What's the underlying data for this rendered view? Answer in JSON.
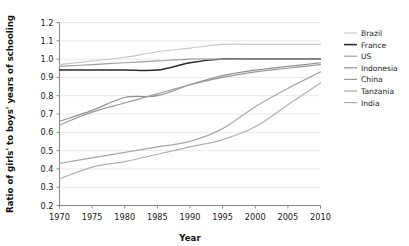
{
  "chart_data": {
    "type": "line",
    "title": "",
    "xlabel": "Year",
    "ylabel": "Ratio of girls' to boys' years of schooling",
    "xlim": [
      1970,
      2010
    ],
    "ylim": [
      0.2,
      1.2
    ],
    "xticks": [
      1970,
      1975,
      1980,
      1985,
      1990,
      1995,
      2000,
      2005,
      2010
    ],
    "yticks": [
      0.2,
      0.3,
      0.4,
      0.5,
      0.6,
      0.7,
      0.8,
      0.9,
      1.0,
      1.1,
      1.2
    ],
    "xtick_labels": [
      "1970",
      "1975",
      "1980",
      "1985",
      "1990",
      "1995",
      "2000",
      "2005",
      "2010"
    ],
    "ytick_labels": [
      "0.2",
      "0.3",
      "0.4",
      "0.5",
      "0.6",
      "0.7",
      "0.8",
      "0.9",
      "1.0",
      "1.1",
      "1.2"
    ],
    "grid": true,
    "legend_position": "right",
    "x": [
      1970,
      1975,
      1980,
      1985,
      1990,
      1995,
      2000,
      2005,
      2010
    ],
    "series": [
      {
        "name": "Brazil",
        "color": "#c8c8c8",
        "width": 1.2,
        "values": [
          0.97,
          0.99,
          1.01,
          1.04,
          1.06,
          1.08,
          1.08,
          1.08,
          1.08
        ]
      },
      {
        "name": "France",
        "color": "#2b2b2b",
        "width": 1.5,
        "values": [
          0.94,
          0.94,
          0.94,
          0.94,
          0.98,
          1.0,
          1.0,
          1.0,
          1.0
        ]
      },
      {
        "name": "US",
        "color": "#9e9e9e",
        "width": 1.2,
        "values": [
          0.96,
          0.97,
          0.98,
          0.99,
          1.0,
          1.0,
          1.0,
          1.0,
          1.0
        ]
      },
      {
        "name": "Indonesia",
        "color": "#8f8f8f",
        "width": 1.2,
        "values": [
          0.66,
          0.72,
          0.79,
          0.8,
          0.86,
          0.91,
          0.94,
          0.96,
          0.98
        ]
      },
      {
        "name": "China",
        "color": "#9a9a9a",
        "width": 1.2,
        "values": [
          0.64,
          0.71,
          0.76,
          0.81,
          0.86,
          0.9,
          0.93,
          0.95,
          0.97
        ]
      },
      {
        "name": "Tanzania",
        "color": "#a8a8a8",
        "width": 1.2,
        "values": [
          0.43,
          0.46,
          0.49,
          0.52,
          0.55,
          0.62,
          0.74,
          0.84,
          0.93
        ]
      },
      {
        "name": "India",
        "color": "#b0b0b0",
        "width": 1.2,
        "values": [
          0.345,
          0.41,
          0.44,
          0.48,
          0.52,
          0.56,
          0.63,
          0.75,
          0.87
        ]
      }
    ],
    "legend": [
      {
        "label": "Brazil",
        "color": "#c8c8c8"
      },
      {
        "label": "France",
        "color": "#2b2b2b"
      },
      {
        "label": "US",
        "color": "#9e9e9e"
      },
      {
        "label": "Indonesia",
        "color": "#8f8f8f"
      },
      {
        "label": "China",
        "color": "#9a9a9a"
      },
      {
        "label": "Tanzania",
        "color": "#a8a8a8"
      },
      {
        "label": "India",
        "color": "#b0b0b0"
      }
    ]
  }
}
